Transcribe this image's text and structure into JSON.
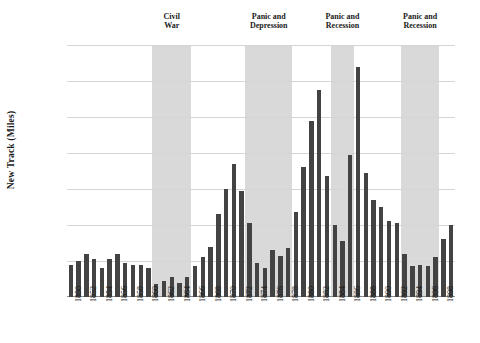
{
  "chart_data": {
    "type": "bar",
    "title": "",
    "xlabel": "",
    "ylabel": "New Track (Miles)",
    "ylim": [
      0,
      14000
    ],
    "ytick_labels": [
      "0",
      "2,000",
      "4,000",
      "6,000",
      "8,000",
      "10,000",
      "12,000",
      "14,000"
    ],
    "ytick_values": [
      0,
      2000,
      4000,
      6000,
      8000,
      10000,
      12000,
      14000
    ],
    "grid": true,
    "legend": "none",
    "bar_color": "#434343",
    "band_color": "#d9d9d9",
    "x": [
      1850,
      1851,
      1852,
      1853,
      1854,
      1855,
      1856,
      1857,
      1858,
      1859,
      1860,
      1861,
      1862,
      1863,
      1864,
      1865,
      1866,
      1867,
      1868,
      1869,
      1870,
      1871,
      1872,
      1873,
      1874,
      1875,
      1876,
      1877,
      1878,
      1879,
      1880,
      1881,
      1882,
      1883,
      1884,
      1885,
      1886,
      1887,
      1888,
      1889,
      1890,
      1891,
      1892,
      1893,
      1894,
      1895,
      1896,
      1897,
      1898,
      1899
    ],
    "xtick_labels": [
      "1850",
      "1852",
      "1854",
      "1856",
      "1858",
      "1860",
      "1862",
      "1864",
      "1866",
      "1868",
      "1870",
      "1872",
      "1874",
      "1876",
      "1878",
      "1880",
      "1882",
      "1884",
      "1886",
      "1888",
      "1890",
      "1892",
      "1894",
      "1896",
      "1898"
    ],
    "values": [
      1800,
      2000,
      2400,
      2100,
      1600,
      2100,
      2400,
      1900,
      1800,
      1800,
      1600,
      700,
      900,
      1100,
      800,
      1100,
      1700,
      2200,
      2800,
      4600,
      6000,
      7400,
      5900,
      4100,
      1900,
      1600,
      2600,
      2300,
      2700,
      4700,
      7200,
      9800,
      11500,
      6700,
      4000,
      3100,
      7900,
      12800,
      6900,
      5400,
      5000,
      4200,
      4100,
      2400,
      1700,
      1800,
      1700,
      2200,
      3200,
      4000
    ],
    "annotations": [
      {
        "label": "Civil War",
        "start": 1861,
        "end": 1865,
        "lines": [
          "Civil",
          "War"
        ]
      },
      {
        "label": "Panic and Depression",
        "start": 1873,
        "end": 1878,
        "lines": [
          "Panic and",
          "Depression"
        ]
      },
      {
        "label": "Panic and Recession",
        "start": 1884,
        "end": 1886,
        "lines": [
          "Panic and",
          "Recession"
        ]
      },
      {
        "label": "Panic and Recession",
        "start": 1893,
        "end": 1897,
        "lines": [
          "Panic and",
          "Recession"
        ]
      }
    ]
  }
}
